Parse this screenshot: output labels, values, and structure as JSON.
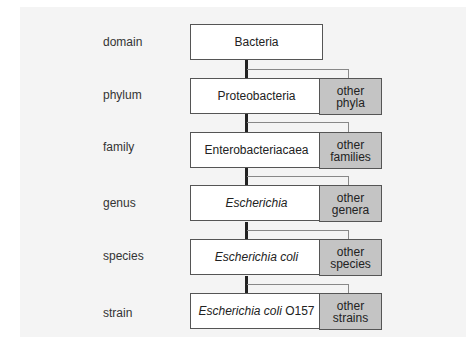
{
  "diagram": {
    "levels": [
      {
        "rank": "domain",
        "taxon": "Bacteria",
        "taxon_italic": "",
        "taxon_plain": "Bacteria",
        "other": null
      },
      {
        "rank": "phylum",
        "taxon": "Proteobacteria",
        "taxon_italic": "",
        "taxon_plain": "Proteobacteria",
        "other": {
          "line1": "other",
          "line2": "phyla"
        }
      },
      {
        "rank": "family",
        "taxon": "Enterobacteriacaea",
        "taxon_italic": "",
        "taxon_plain": "Enterobacteriacaea",
        "other": {
          "line1": "other",
          "line2": "families"
        }
      },
      {
        "rank": "genus",
        "taxon": "Escherichia",
        "taxon_italic": "Escherichia",
        "taxon_plain": "",
        "other": {
          "line1": "other",
          "line2": "genera"
        }
      },
      {
        "rank": "species",
        "taxon": "Escherichia coli",
        "taxon_italic": "Escherichia coli",
        "taxon_plain": "",
        "other": {
          "line1": "other",
          "line2": "species"
        }
      },
      {
        "rank": "strain",
        "taxon": "Escherichia coli O157",
        "taxon_italic": "Escherichia coli",
        "taxon_plain": " O157",
        "other": {
          "line1": "other",
          "line2": "strains"
        }
      }
    ]
  },
  "colors": {
    "background": "#f4f4f4",
    "main_box": "#ffffff",
    "other_box": "#c4c4c4",
    "trunk_line": "#222222",
    "branch_line": "#888888"
  }
}
